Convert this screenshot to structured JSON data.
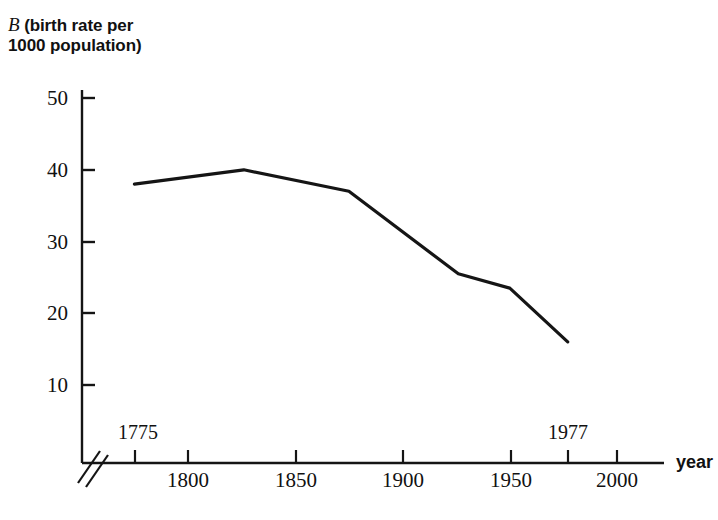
{
  "chart_data": {
    "type": "line",
    "title": "",
    "subtitle": "",
    "ylabel_line1": "B (birth rate per",
    "ylabel_line2": "1000 population)",
    "ylabel_variable": "B",
    "ylabel_rest_line1": " (birth rate per",
    "xlabel": "year",
    "x": [
      1775,
      1826,
      1875,
      1926,
      1950,
      1977
    ],
    "values": [
      38,
      40,
      37,
      25.5,
      23.5,
      16
    ],
    "series": [
      {
        "name": "birth rate per 1000 population",
        "values": [
          38,
          40,
          37,
          25.5,
          23.5,
          16
        ]
      }
    ],
    "xlim": [
      1775,
      2010
    ],
    "ylim": [
      0,
      52
    ],
    "xticks": [
      1800,
      1850,
      1900,
      1950,
      2000
    ],
    "xtick_labels": [
      "1800",
      "1850",
      "1900",
      "1950",
      "2000"
    ],
    "yticks": [
      10,
      20,
      30,
      40,
      50
    ],
    "ytick_labels": [
      "10",
      "20",
      "30",
      "40",
      "50"
    ],
    "annotations": [
      {
        "name": "start-year",
        "text": "1775",
        "x": 1775
      },
      {
        "name": "end-year",
        "text": "1977",
        "x": 1977
      }
    ],
    "axis_break": "double-slash",
    "grid": false,
    "legend": false,
    "line_color": "#151515",
    "axis_color": "#151515",
    "background_color": "#ffffff"
  }
}
